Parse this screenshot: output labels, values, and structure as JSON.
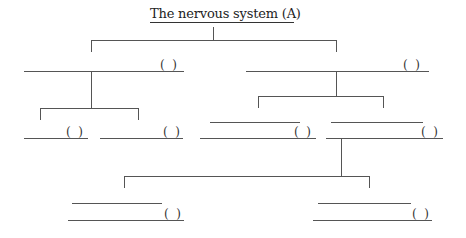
{
  "diagram": {
    "title": "The nervous system (A)",
    "blank_label": "(  )",
    "nodes": [
      {
        "id": "root",
        "label": "The nervous system (A)"
      },
      {
        "id": "left",
        "label": "(  )"
      },
      {
        "id": "right",
        "label": "(  )"
      },
      {
        "id": "left-child-1",
        "label": "(  )"
      },
      {
        "id": "left-child-2",
        "label": "(  )"
      },
      {
        "id": "right-child-1",
        "label": "(  )"
      },
      {
        "id": "right-child-2",
        "label": "(  )"
      },
      {
        "id": "right-grandchild-1",
        "label": "(  )"
      },
      {
        "id": "right-grandchild-2",
        "label": "(  )"
      }
    ],
    "line_color": "#555555"
  }
}
